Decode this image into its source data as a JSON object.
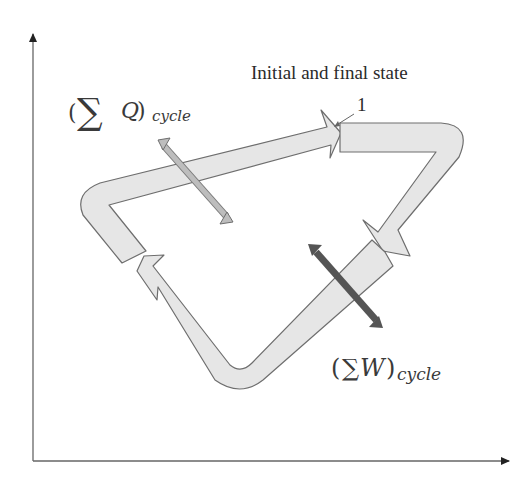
{
  "diagram": {
    "type": "thermodynamic-cycle",
    "axes": {
      "x_label": "",
      "y_label": "",
      "color": "#555555"
    },
    "state_label": {
      "text": "Initial and final state",
      "number": "1"
    },
    "heat_label": {
      "open": "(",
      "sigma": "∑",
      "symbol": "Q",
      "close": ")",
      "subscript": "cycle"
    },
    "work_label": {
      "open": "(",
      "sigma": "∑",
      "symbol": "W",
      "close": ")",
      "subscript": "cycle"
    },
    "colors": {
      "band_fill": "#e6e6e6",
      "band_stroke": "#6e6e6e",
      "heat_arrow": "#b4b4b4",
      "work_arrow": "#555555",
      "text": "#2a2a2a"
    },
    "process_direction": "clockwise"
  }
}
